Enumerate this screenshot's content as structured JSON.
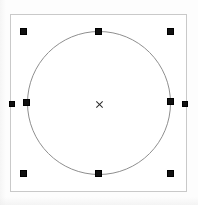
{
  "canvas": {
    "width": 198,
    "height": 205,
    "background_color": "#fdfdfd",
    "label": "drawing-canvas"
  },
  "selection": {
    "object_type": "circle",
    "state_label": "selected",
    "handle_color": "#111111",
    "handle_size": 7,
    "bounding_box": {
      "x": 10,
      "y": 14,
      "width": 177,
      "height": 178,
      "border_color": "#c9c9c9"
    },
    "handles": [
      {
        "name": "handle-top-left",
        "x": 20,
        "y": 28,
        "role": "resize-nw"
      },
      {
        "name": "handle-top-center",
        "x": 95,
        "y": 28,
        "role": "resize-n"
      },
      {
        "name": "handle-top-right",
        "x": 167,
        "y": 28,
        "role": "resize-ne"
      },
      {
        "name": "handle-middle-left",
        "x": 23,
        "y": 99,
        "role": "resize-w"
      },
      {
        "name": "handle-middle-right",
        "x": 167,
        "y": 98,
        "role": "resize-e"
      },
      {
        "name": "handle-bottom-left",
        "x": 20,
        "y": 170,
        "role": "resize-sw"
      },
      {
        "name": "handle-bottom-center",
        "x": 95,
        "y": 170,
        "role": "resize-s"
      },
      {
        "name": "handle-bottom-right",
        "x": 167,
        "y": 170,
        "role": "resize-se"
      }
    ],
    "edge_grips": [
      {
        "name": "grip-left-edge",
        "x": 9,
        "y": 101,
        "role": "edge-handle-w"
      },
      {
        "name": "grip-right-edge",
        "x": 182,
        "y": 101,
        "role": "edge-handle-e"
      }
    ],
    "center_marker": {
      "name": "center-point-marker",
      "x": 95,
      "y": 99,
      "glyph": "x",
      "color": "#2a2a2a"
    }
  },
  "shape": {
    "type": "circle",
    "stroke_color": "#8f8f8f",
    "fill": "none",
    "center_x": 99,
    "center_y": 103,
    "radius": 72,
    "left": 27,
    "top": 31,
    "diameter": 144
  }
}
